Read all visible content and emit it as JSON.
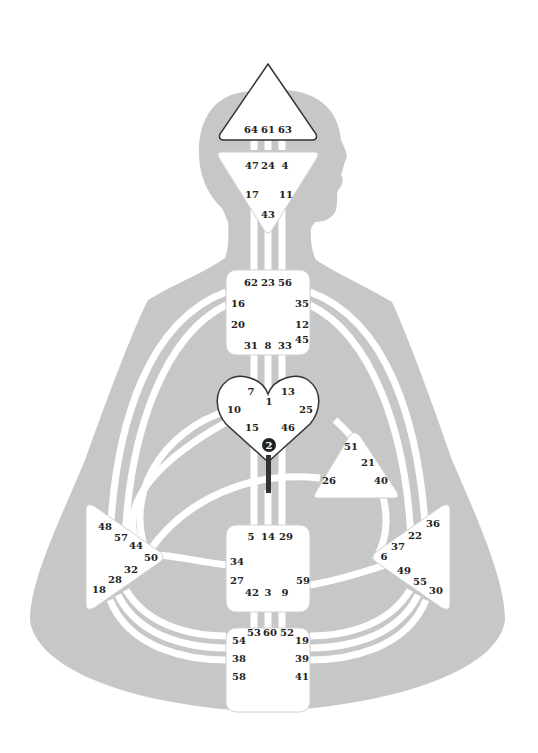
{
  "diagram": {
    "type": "human-design-bodygraph",
    "colors": {
      "silhouette": "#c7c7c7",
      "channel": "#ffffff",
      "center_fill": "#ffffff",
      "center_stroke_defined": "#333333",
      "center_stroke_open": "#bdbdbd",
      "gate_text": "#222222",
      "active_gate": "#222222"
    },
    "centers": {
      "head": {
        "label": "Head",
        "shape": "triangle-up",
        "defined": true,
        "gates": [
          "64",
          "61",
          "63"
        ]
      },
      "ajna": {
        "label": "Ajna",
        "shape": "triangle-down",
        "defined": false,
        "gates": [
          "47",
          "24",
          "4",
          "17",
          "11",
          "43"
        ]
      },
      "throat": {
        "label": "Throat",
        "shape": "square",
        "defined": false,
        "gates": [
          "62",
          "23",
          "56",
          "16",
          "35",
          "20",
          "12",
          "45",
          "31",
          "8",
          "33"
        ]
      },
      "g": {
        "label": "G",
        "shape": "heart",
        "defined": true,
        "gates": [
          "7",
          "1",
          "13",
          "10",
          "25",
          "15",
          "46"
        ]
      },
      "active_gate": {
        "gate": "2",
        "label": "2"
      },
      "ego": {
        "label": "Heart/Ego",
        "shape": "triangle",
        "defined": false,
        "gates": [
          "51",
          "21",
          "26",
          "40"
        ]
      },
      "spleen": {
        "label": "Spleen",
        "shape": "triangle-right",
        "defined": false,
        "gates": [
          "48",
          "57",
          "44",
          "50",
          "32",
          "28",
          "18"
        ]
      },
      "solar_plexus": {
        "label": "Solar Plexus",
        "shape": "triangle-left",
        "defined": false,
        "gates": [
          "36",
          "22",
          "37",
          "6",
          "49",
          "55",
          "30"
        ]
      },
      "sacral": {
        "label": "Sacral",
        "shape": "square",
        "defined": false,
        "gates": [
          "5",
          "14",
          "29",
          "34",
          "27",
          "59",
          "42",
          "3",
          "9"
        ]
      },
      "root": {
        "label": "Root",
        "shape": "square",
        "defined": false,
        "gates": [
          "53",
          "60",
          "52",
          "54",
          "19",
          "38",
          "39",
          "58",
          "41"
        ]
      }
    }
  }
}
